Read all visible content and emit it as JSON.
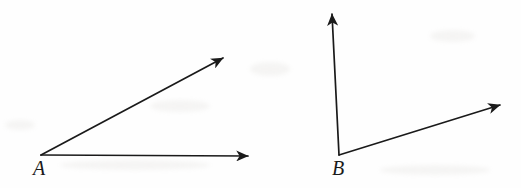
{
  "figure": {
    "type": "geometry-diagram",
    "background_color": "#fefefe",
    "stroke_color": "#1a1a1a",
    "stroke_width": 1.7,
    "width": 521,
    "height": 188,
    "angles": [
      {
        "name": "angle-a",
        "vertex_label": "A",
        "vertex_label_position": {
          "x": 33,
          "y": 158
        },
        "vertex": {
          "x": 41,
          "y": 155
        },
        "rays": [
          {
            "name": "ray-a-upper",
            "from": {
              "x": 41,
              "y": 155
            },
            "to": {
              "x": 223,
              "y": 58
            },
            "arrowhead": "filled-barbed",
            "arrow_at": "to"
          },
          {
            "name": "ray-a-horizontal",
            "from": {
              "x": 41,
              "y": 155
            },
            "to": {
              "x": 248,
              "y": 156
            },
            "arrowhead": "filled-barbed",
            "arrow_at": "to"
          }
        ]
      },
      {
        "name": "angle-b",
        "vertex_label": "B",
        "vertex_label_position": {
          "x": 332,
          "y": 158
        },
        "vertex": {
          "x": 339,
          "y": 155
        },
        "rays": [
          {
            "name": "ray-b-vertical",
            "from": {
              "x": 339,
              "y": 155
            },
            "to": {
              "x": 332,
              "y": 14
            },
            "arrowhead": "filled-barbed",
            "arrow_at": "to"
          },
          {
            "name": "ray-b-slanted",
            "from": {
              "x": 339,
              "y": 155
            },
            "to": {
              "x": 500,
              "y": 105
            },
            "arrowhead": "filled-barbed",
            "arrow_at": "to"
          }
        ]
      }
    ]
  }
}
